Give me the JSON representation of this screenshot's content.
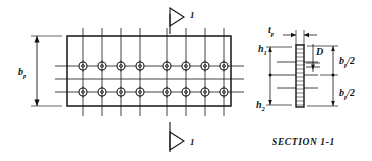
{
  "drawing": {
    "title": "Bolted splice plate detail",
    "stroke_color": "#141414",
    "background": "#ffffff"
  },
  "plan_view": {
    "name": "plan-view",
    "plate": {
      "x": 67,
      "y": 36,
      "width": 164,
      "height": 70,
      "label": "b_p",
      "label_text": "b",
      "label_sub": "p"
    },
    "dimension_left": {
      "name": "bp-dimension",
      "x": 37,
      "y_top": 36,
      "y_bottom": 106,
      "text": "b",
      "sub": "p"
    },
    "bolt_rows_y": [
      66,
      92
    ],
    "bolt_columns_x": [
      83,
      102,
      121,
      140,
      167,
      186,
      205,
      224
    ],
    "bolt_radius": 4.0,
    "bolt_inner_radius": 1.4,
    "bolt_count": 16,
    "horizontal_centerlines_y": [
      66,
      79,
      92
    ],
    "centerline_x_start": 55,
    "centerline_x_end": 244,
    "vertical_centerline_y_start": 28,
    "vertical_centerline_y_end": 116
  },
  "section_marks": [
    {
      "name": "section-mark-top",
      "label": "1",
      "x": 170,
      "y_line_top": 14,
      "y_line_bottom": 34,
      "arrow_y": 17,
      "label_x": 190,
      "label_y": 18
    },
    {
      "name": "section-mark-bottom",
      "label": "1",
      "x": 170,
      "y_line_top": 122,
      "y_line_bottom": 152,
      "arrow_y": 141,
      "label_x": 190,
      "label_y": 145
    }
  ],
  "section_view": {
    "name": "section-view",
    "caption": "SECTION 1-1",
    "caption_x": 272,
    "caption_y": 144,
    "plate": {
      "x": 296,
      "y": 45,
      "width": 8,
      "height": 62
    },
    "labels": {
      "tp": {
        "text": "t",
        "sub": "p",
        "x": 272,
        "y": 35
      },
      "D": {
        "text": "D",
        "x": 320,
        "y": 48
      },
      "h1": {
        "text": "h",
        "sub": "1",
        "x": 259,
        "y": 54
      },
      "h2": {
        "text": "h",
        "sub": "2",
        "x": 258,
        "y": 107
      },
      "bp_half_upper": {
        "text": "b",
        "sub": "p",
        "tail": "/2",
        "x": 341,
        "y": 64
      },
      "bp_half_lower": {
        "text": "b",
        "sub": "p",
        "tail": "/2",
        "x": 341,
        "y": 95
      }
    },
    "bolt_levels_y": [
      62,
      88
    ],
    "mid_level_y": 75,
    "hatch_lines_y": [
      49,
      53,
      57,
      61,
      65,
      69,
      73,
      77,
      81,
      85,
      89,
      93,
      97,
      101,
      105
    ],
    "dimension_right_x": 333,
    "dimension_left_x": 268
  }
}
